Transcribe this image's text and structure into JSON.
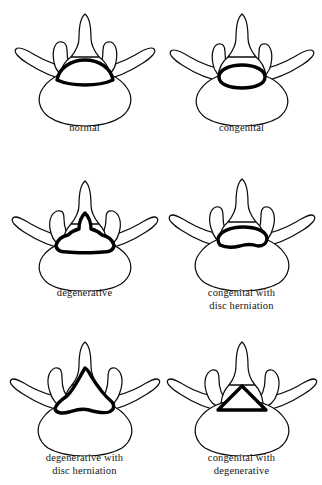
{
  "figure": {
    "background_color": "#ffffff",
    "outline_color": "#0d0d0d",
    "canal_color": "#000000",
    "rows": 3,
    "columns": 2
  },
  "panels": [
    {
      "id": "normal",
      "caption": "normal",
      "canal_shape": "dome",
      "canal_description": "Wide rounded dome-shaped canal with flat base; normal capacity",
      "row": 0,
      "column": 0
    },
    {
      "id": "congenital",
      "caption": "congenital",
      "canal_shape": "small-oval",
      "canal_description": "Small flattened oval canal from congenitally short pedicles",
      "row": 0,
      "column": 1
    },
    {
      "id": "degenerative",
      "caption": "degenerative",
      "canal_shape": "trefoil",
      "canal_description": "Trefoil canal with central peak and narrowed lateral recesses from facet hypertrophy",
      "row": 1,
      "column": 0
    },
    {
      "id": "congenital-with-disc-herniation",
      "caption": "congenital with\ndisc herniation",
      "canal_shape": "oval-with-posterior-disc-indentation",
      "canal_description": "Small oval canal further narrowed by anterior disc herniation indenting the floor",
      "row": 1,
      "column": 1
    },
    {
      "id": "degenerative-with-disc-herniation",
      "caption": "degenerative with\ndisc herniation",
      "canal_shape": "trefoil-with-disc-indentation",
      "canal_description": "Trefoil canal with peaked roof and wavy indented floor from disc herniation",
      "row": 2,
      "column": 0
    },
    {
      "id": "congenital-with-degenerative",
      "caption": "congenital with\ndegenerative",
      "canal_shape": "small-triangle",
      "canal_description": "Severely reduced small triangular canal combining congenital narrowing and degenerative change",
      "row": 2,
      "column": 1
    }
  ],
  "anatomy_labels": {
    "vertebral_body": "vertebral body",
    "pedicle": "pedicle",
    "transverse_process": "transverse process",
    "superior_articular_process": "superior articular process",
    "lamina": "lamina",
    "spinous_process": "spinous process",
    "spinal_canal": "spinal canal"
  }
}
